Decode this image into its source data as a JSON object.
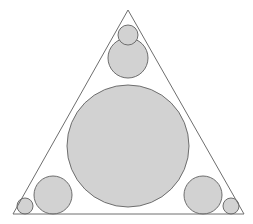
{
  "figure": {
    "canvas": {
      "width": 253,
      "height": 224,
      "background": "#ffffff"
    },
    "style": {
      "circle_fill": "#d2d2d2",
      "circle_stroke": "#6e6e6e",
      "circle_stroke_width": 1,
      "triangle_fill": "none",
      "triangle_stroke": "#6e6e6e",
      "triangle_stroke_width": 1
    },
    "triangle": {
      "name": "isosceles-triangle",
      "points": "128,10 244,214 13,214",
      "vertices": [
        {
          "label": "apex",
          "x": 128,
          "y": 10
        },
        {
          "label": "bottom-right",
          "x": 244,
          "y": 214
        },
        {
          "label": "bottom-left",
          "x": 13,
          "y": 214
        }
      ]
    },
    "circles": [
      {
        "name": "incircle-large",
        "cx": 128,
        "cy": 146,
        "r": 61
      },
      {
        "name": "upper-medium-circle",
        "cx": 128,
        "cy": 58,
        "r": 20
      },
      {
        "name": "apex-small-circle",
        "cx": 128,
        "cy": 35,
        "r": 10
      },
      {
        "name": "bottom-left-medium-circle",
        "cx": 53,
        "cy": 195,
        "r": 19
      },
      {
        "name": "bottom-right-medium-circle",
        "cx": 203,
        "cy": 195,
        "r": 19
      },
      {
        "name": "bottom-left-small-circle",
        "cx": 25,
        "cy": 206,
        "r": 8
      },
      {
        "name": "bottom-right-small-circle",
        "cx": 231,
        "cy": 206,
        "r": 8
      }
    ]
  }
}
